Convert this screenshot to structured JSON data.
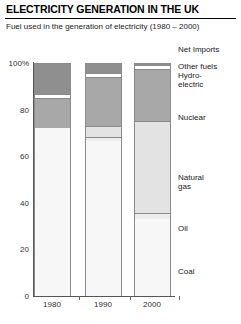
{
  "header": {
    "title": "ELECTRICITY GENERATION IN THE UK",
    "subtitle": "Fuel used in the generation of electricity (1980 – 2000)"
  },
  "annotations": {
    "net_imports": "Net Imports",
    "other_fuels": "Other fuels",
    "hydro_electric": "Hydro-\nelectric",
    "nuclear": "Nuclear",
    "natural_gas": "Natural\ngas",
    "oil": "Oil",
    "coal": "Coal"
  },
  "chart_data": {
    "type": "bar",
    "subtype": "stacked-100-percent",
    "title": "ELECTRICITY GENERATION IN THE UK",
    "subtitle": "Fuel used in the generation of electricity (1980 – 2000)",
    "xlabel": "",
    "ylabel": "",
    "ylim": [
      0,
      100
    ],
    "yticks": [
      "0",
      "20",
      "40",
      "60",
      "80",
      "100%"
    ],
    "ytick_values": [
      0,
      20,
      40,
      60,
      80,
      100
    ],
    "grid": false,
    "legend": "right-side-labels",
    "categories": [
      "1980",
      "1990",
      "2000"
    ],
    "series": [
      {
        "name": "Coal",
        "color": "#f7f7f7",
        "values": [
          72.0,
          66.5,
          33.0
        ]
      },
      {
        "name": "Oil",
        "color": "#ededed",
        "values": [
          0.0,
          1.8,
          2.5
        ]
      },
      {
        "name": "Natural gas",
        "color": "#e3e3e3",
        "values": [
          0.0,
          4.5,
          39.5
        ]
      },
      {
        "name": "Nuclear",
        "color": "#a8a8a8",
        "values": [
          13.0,
          21.0,
          22.5
        ]
      },
      {
        "name": "Hydro-electric",
        "color": "#ffffff",
        "values": [
          1.5,
          2.0,
          1.5
        ]
      },
      {
        "name": "Other fuels",
        "color": "#8f8f8f",
        "values": [
          13.5,
          4.2,
          1.0
        ]
      }
    ]
  }
}
